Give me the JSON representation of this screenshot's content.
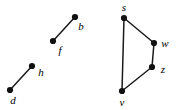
{
  "figure": {
    "background_color": "#ffffff",
    "stroke_color": "#1a1a1a",
    "node_color": "#111111",
    "node_radius": 3.1,
    "edge_width": 1.5,
    "width": 183,
    "height": 110
  },
  "chart_data": {
    "type": "diagram",
    "subtype": "undirected-graph",
    "title": "",
    "xlabel": "",
    "ylabel": "",
    "grid": false,
    "legend": null,
    "components": [
      {
        "name": "left-component",
        "nodes": [
          {
            "id": "b",
            "label": "b",
            "x": 75,
            "y": 17,
            "label_x": 81,
            "label_y": 26
          },
          {
            "id": "f",
            "label": "f",
            "x": 53,
            "y": 41,
            "label_x": 60,
            "label_y": 50
          },
          {
            "id": "h",
            "label": "h",
            "x": 32,
            "y": 66,
            "label_x": 41,
            "label_y": 72
          },
          {
            "id": "d",
            "label": "d",
            "x": 10,
            "y": 90,
            "label_x": 13,
            "label_y": 100
          }
        ],
        "edges": [
          {
            "from": "b",
            "to": "f"
          },
          {
            "from": "h",
            "to": "d"
          }
        ]
      },
      {
        "name": "right-component",
        "nodes": [
          {
            "id": "s",
            "label": "s",
            "x": 124,
            "y": 18,
            "label_x": 124,
            "label_y": 7
          },
          {
            "id": "w",
            "label": "w",
            "x": 154,
            "y": 43,
            "label_x": 165,
            "label_y": 43
          },
          {
            "id": "z",
            "label": "z",
            "x": 152,
            "y": 67,
            "label_x": 163,
            "label_y": 69
          },
          {
            "id": "v",
            "label": "v",
            "x": 122,
            "y": 91,
            "label_x": 122,
            "label_y": 102
          }
        ],
        "edges": [
          {
            "from": "s",
            "to": "w"
          },
          {
            "from": "w",
            "to": "z"
          },
          {
            "from": "z",
            "to": "v"
          },
          {
            "from": "s",
            "to": "v"
          }
        ]
      }
    ]
  }
}
